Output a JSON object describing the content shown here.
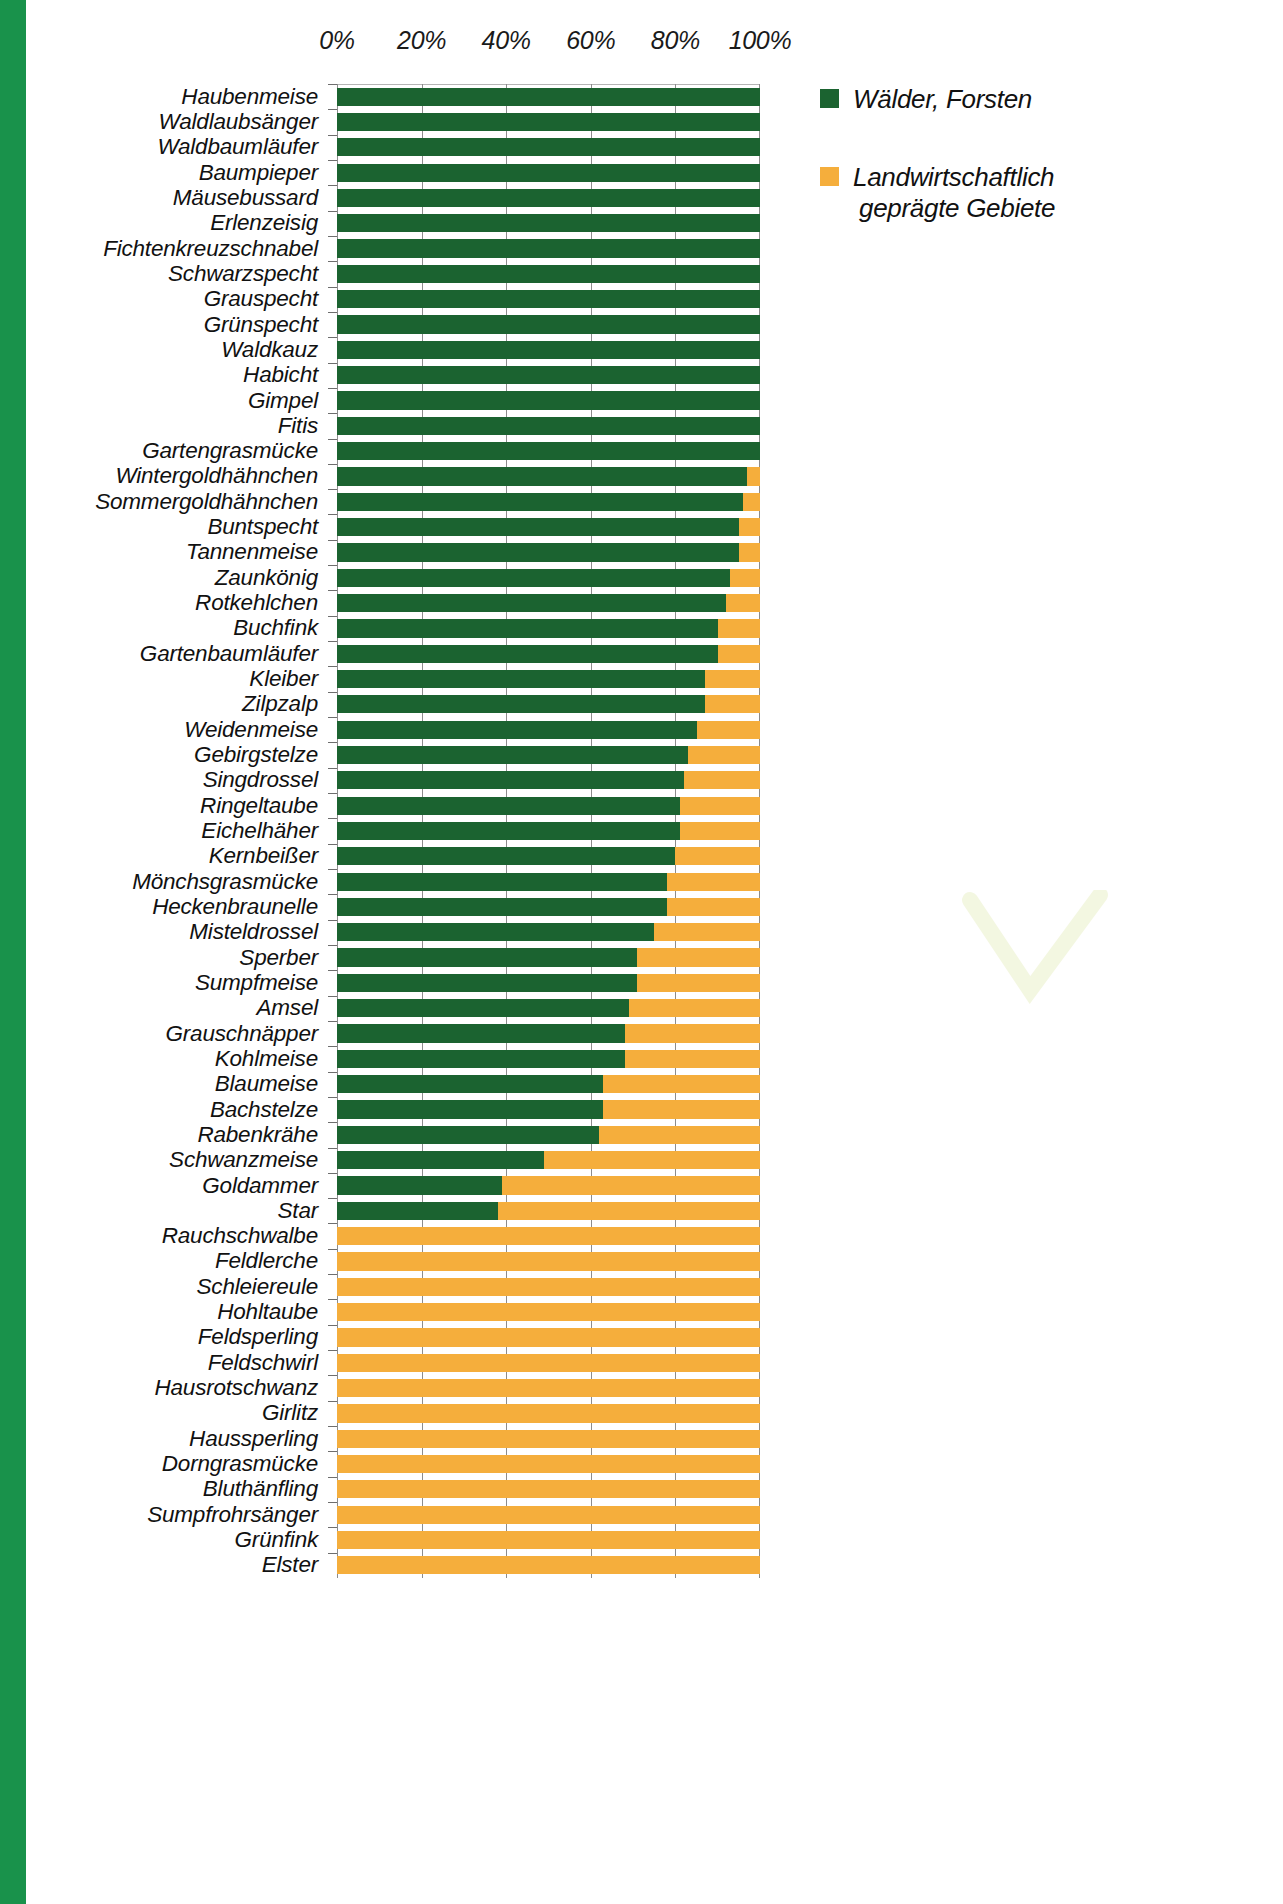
{
  "legend": {
    "entries": [
      {
        "label": "Wälder, Forsten",
        "label_line2": "",
        "color": "#1b6330",
        "swatch_name": "forest-swatch"
      },
      {
        "label": "Landwirtschaftlich",
        "label_line2": "geprägte Gebiete",
        "color": "#f5ae3c",
        "swatch_name": "agriculture-swatch"
      }
    ]
  },
  "axis": {
    "ticks": [
      "0%",
      "20%",
      "40%",
      "60%",
      "80%",
      "100%"
    ],
    "tick_values": [
      0,
      20,
      40,
      60,
      80,
      100
    ],
    "min": 0,
    "max": 100
  },
  "colors": {
    "forest": "#1b6330",
    "agriculture": "#f5ae3c",
    "edge_stripe": "#19924b",
    "gridline": "#8c8c8c",
    "text": "#111111",
    "background": "#ffffff"
  },
  "chart_data": {
    "type": "bar",
    "subtype": "stacked-horizontal-100pct",
    "title": "",
    "subtitle": "",
    "xlabel": "",
    "ylabel": "",
    "xlim": [
      0,
      100
    ],
    "grid": true,
    "legend_position": "right",
    "xticks": [
      0,
      20,
      40,
      60,
      80,
      100
    ],
    "xticklabels": [
      "0%",
      "20%",
      "40%",
      "60%",
      "80%",
      "100%"
    ],
    "categories": [
      "Haubenmeise",
      "Waldlaubsänger",
      "Waldbaumläufer",
      "Baumpieper",
      "Mäusebussard",
      "Erlenzeisig",
      "Fichtenkreuzschnabel",
      "Schwarzspecht",
      "Grauspecht",
      "Grünspecht",
      "Waldkauz",
      "Habicht",
      "Gimpel",
      "Fitis",
      "Gartengrasmücke",
      "Wintergoldhähnchen",
      "Sommergoldhähnchen",
      "Buntspecht",
      "Tannenmeise",
      "Zaunkönig",
      "Rotkehlchen",
      "Buchfink",
      "Gartenbaumläufer",
      "Kleiber",
      "Zilpzalp",
      "Weidenmeise",
      "Gebirgstelze",
      "Singdrossel",
      "Ringeltaube",
      "Eichelhäher",
      "Kernbeißer",
      "Mönchsgrasmücke",
      "Heckenbraunelle",
      "Misteldrossel",
      "Sperber",
      "Sumpfmeise",
      "Amsel",
      "Grauschnäpper",
      "Kohlmeise",
      "Blaumeise",
      "Bachstelze",
      "Rabenkrähe",
      "Schwanzmeise",
      "Goldammer",
      "Star",
      "Rauchschwalbe",
      "Feldlerche",
      "Schleiereule",
      "Hohltaube",
      "Feldsperling",
      "Feldschwirl",
      "Hausrotschwanz",
      "Girlitz",
      "Haussperling",
      "Dorngrasmücke",
      "Bluthänfling",
      "Sumpfrohrsänger",
      "Grünfink",
      "Elster"
    ],
    "series": [
      {
        "name": "Wälder, Forsten",
        "color": "#1b6330",
        "values": [
          100,
          100,
          100,
          100,
          100,
          100,
          100,
          100,
          100,
          100,
          100,
          100,
          100,
          100,
          100,
          97,
          96,
          95,
          95,
          93,
          92,
          90,
          90,
          87,
          87,
          85,
          83,
          82,
          81,
          81,
          80,
          78,
          78,
          75,
          71,
          71,
          69,
          68,
          68,
          63,
          63,
          62,
          49,
          39,
          38,
          0,
          0,
          0,
          0,
          0,
          0,
          0,
          0,
          0,
          0,
          0,
          0,
          0,
          0
        ]
      },
      {
        "name": "Landwirtschaftlich geprägte Gebiete",
        "color": "#f5ae3c",
        "values": [
          0,
          0,
          0,
          0,
          0,
          0,
          0,
          0,
          0,
          0,
          0,
          0,
          0,
          0,
          0,
          3,
          4,
          5,
          5,
          7,
          8,
          10,
          10,
          13,
          13,
          15,
          17,
          18,
          19,
          19,
          20,
          22,
          22,
          25,
          29,
          29,
          31,
          32,
          32,
          37,
          37,
          38,
          51,
          61,
          62,
          100,
          100,
          100,
          100,
          100,
          100,
          100,
          100,
          100,
          100,
          100,
          100,
          100,
          100
        ]
      }
    ]
  }
}
